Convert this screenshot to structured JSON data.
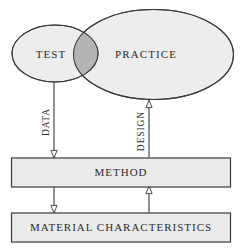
{
  "diagram": {
    "type": "venn-flow-diagram",
    "background_color": "#ffffff",
    "stroke_color": "#3a3a3a",
    "text_color": "#2b2b2b",
    "ellipse_fill": "#ededed",
    "overlap_fill": "#b4b4b4",
    "box_fill": "#ebebeb",
    "nodes": {
      "test": {
        "label": "TEST",
        "shape": "ellipse",
        "fill": "#ededed"
      },
      "practice": {
        "label": "PRACTICE",
        "shape": "ellipse",
        "fill": "#ededed"
      },
      "overlap": {
        "label": "",
        "shape": "lens",
        "fill": "#b4b4b4"
      },
      "method": {
        "label": "METHOD",
        "shape": "rectangle",
        "fill": "#ebebeb"
      },
      "material_characteristics": {
        "label": "MATERIAL CHARACTERISTICS",
        "shape": "rectangle",
        "fill": "#ebebeb"
      }
    },
    "edges": [
      {
        "label": "DATA",
        "from": "test",
        "to": "material-characteristics",
        "direction": "down",
        "orientation": "vertical-text",
        "arrowhead": "hollow-triangle"
      },
      {
        "label": "DESIGN",
        "from": "material-characteristics",
        "to": "practice",
        "direction": "up",
        "orientation": "vertical-text",
        "arrowhead": "hollow-triangle"
      }
    ]
  }
}
